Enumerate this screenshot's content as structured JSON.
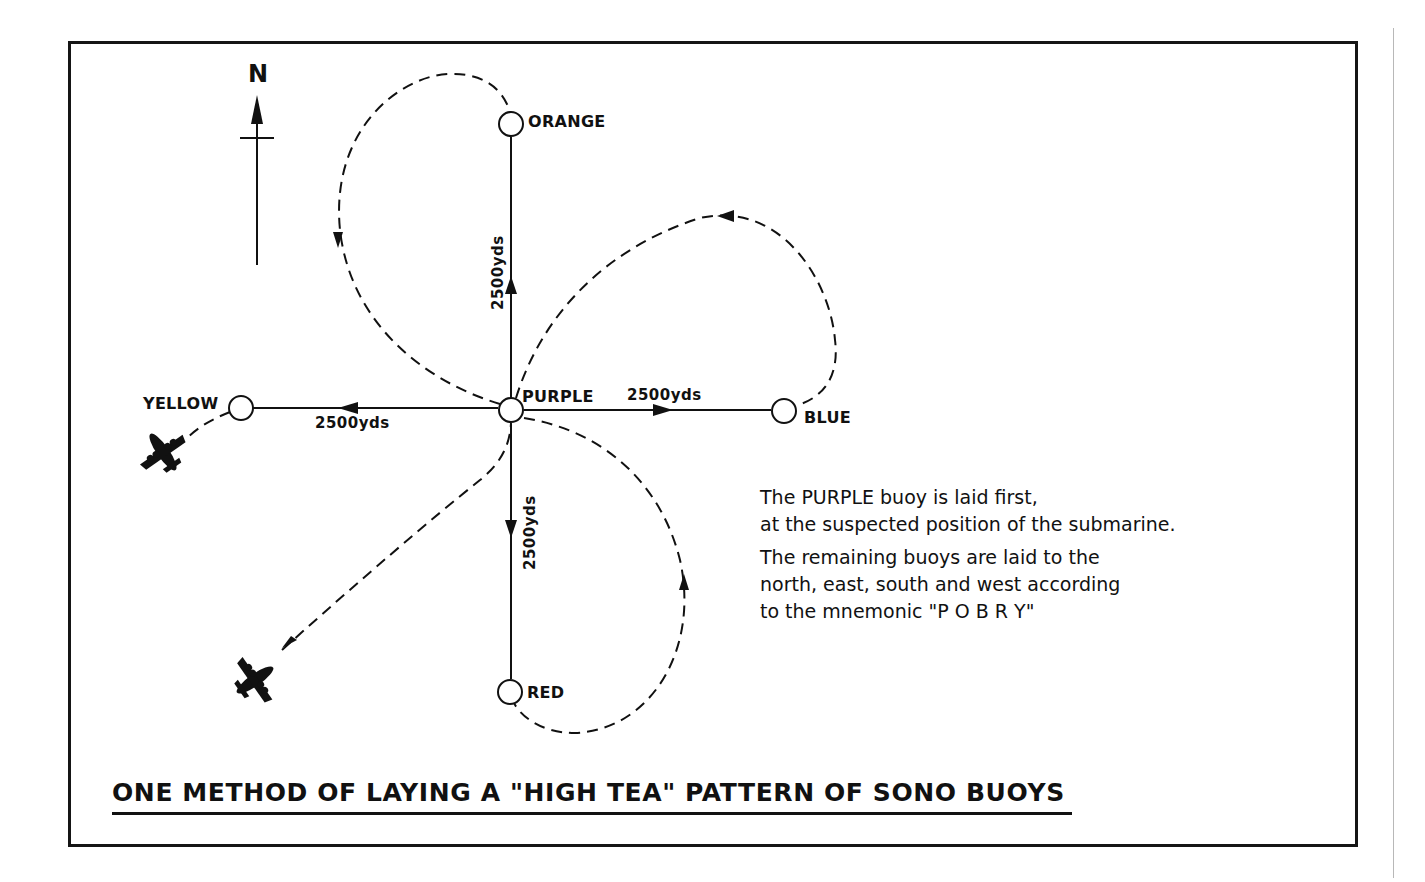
{
  "diagram": {
    "title": "ONE METHOD OF LAYING A \"HIGH TEA\" PATTERN OF SONO BUOYS",
    "north_label": "N",
    "buoys": [
      {
        "id": "purple",
        "label": "PURPLE",
        "order": 1,
        "direction": "center"
      },
      {
        "id": "orange",
        "label": "ORANGE",
        "order": 2,
        "direction": "north"
      },
      {
        "id": "blue",
        "label": "BLUE",
        "order": 3,
        "direction": "east"
      },
      {
        "id": "red",
        "label": "RED",
        "order": 4,
        "direction": "south"
      },
      {
        "id": "yellow",
        "label": "YELLOW",
        "order": 5,
        "direction": "west"
      }
    ],
    "distances": {
      "north": "2500yds",
      "east": "2500yds",
      "south": "2500yds",
      "west": "2500yds"
    },
    "caption": {
      "line1": "The PURPLE buoy is laid first,",
      "line2": "at the suspected position of the submarine.",
      "line3": "The remaining buoys are laid to the",
      "line4": "north, east, south and west according",
      "line5": "to the mnemonic \"P O B R Y\""
    },
    "icons": [
      "north-arrow-icon",
      "aircraft-icon",
      "aircraft-icon",
      "buoy-icon"
    ],
    "colors": {
      "ink": "#111111",
      "paper": "#ffffff",
      "side_rule": "#b8b8b8"
    }
  }
}
